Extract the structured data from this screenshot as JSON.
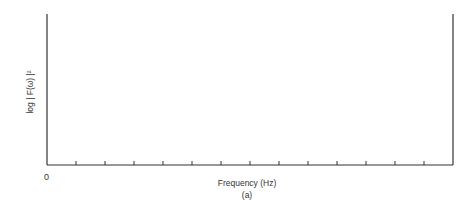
{
  "chart_data": {
    "type": "line",
    "title": "",
    "caption": "(a)",
    "xlabel": "Frequency (Hz)",
    "ylabel": "log | F(ω) |²",
    "x_origin_label": "0",
    "xlim": [
      0,
      14
    ],
    "ylim": [
      0,
      1
    ],
    "x_tick_count": 14,
    "x_tick_spacing": 1,
    "grid": false,
    "legend": "none",
    "annotation": {
      "numerator": "1",
      "denominator": "T",
      "meaning": "null spacing = 1/T",
      "from_x": 2,
      "to_x": 3
    },
    "series": [
      {
        "name": "solid",
        "style": "solid",
        "start_value": 0.48,
        "nulls": [
          {
            "x": 0.45,
            "y": 0.05
          },
          {
            "x": 1.45,
            "y": 0.28
          },
          {
            "x": 2.45,
            "y": 0.29
          },
          {
            "x": 3.45,
            "y": 0.38
          },
          {
            "x": 4.45,
            "y": 0.38
          },
          {
            "x": 5.45,
            "y": 0.34
          },
          {
            "x": 6.45,
            "y": 0.22
          },
          {
            "x": 7.4,
            "y": 0.17
          },
          {
            "x": 8.4,
            "y": 0.22
          },
          {
            "x": 9.4,
            "y": 0.33
          },
          {
            "x": 10.4,
            "y": 0.32
          },
          {
            "x": 11.4,
            "y": 0.16
          }
        ],
        "peaks": [
          {
            "x": 0.95,
            "y": 0.58
          },
          {
            "x": 1.95,
            "y": 0.64
          },
          {
            "x": 2.95,
            "y": 0.76
          },
          {
            "x": 3.95,
            "y": 0.84
          },
          {
            "x": 4.95,
            "y": 0.88
          },
          {
            "x": 5.95,
            "y": 0.77
          },
          {
            "x": 6.9,
            "y": 0.62
          },
          {
            "x": 7.9,
            "y": 0.54
          },
          {
            "x": 8.9,
            "y": 0.56
          },
          {
            "x": 9.9,
            "y": 0.67
          },
          {
            "x": 10.9,
            "y": 0.68
          },
          {
            "x": 11.85,
            "y": 0.52
          },
          {
            "x": 12.8,
            "y": 0.27
          }
        ],
        "end_x": 12.45
      },
      {
        "name": "dashed envelope",
        "style": "dashed",
        "points": [
          [
            0,
            0.14
          ],
          [
            1,
            0.2
          ],
          [
            2,
            0.3
          ],
          [
            3,
            0.44
          ],
          [
            4,
            0.56
          ],
          [
            5,
            0.6
          ],
          [
            5.5,
            0.6
          ],
          [
            6,
            0.56
          ],
          [
            7,
            0.46
          ],
          [
            7.5,
            0.38
          ],
          [
            8,
            0.32
          ],
          [
            8.5,
            0.3
          ],
          [
            9,
            0.3
          ],
          [
            9.5,
            0.32
          ],
          [
            10,
            0.38
          ],
          [
            10.5,
            0.46
          ],
          [
            11,
            0.54
          ],
          [
            11.5,
            0.58
          ],
          [
            12,
            0.56
          ],
          [
            12.5,
            0.42
          ],
          [
            13,
            0.24
          ],
          [
            13.5,
            0.1
          ],
          [
            14,
            0.02
          ],
          [
            14.4,
            0.0
          ]
        ]
      }
    ]
  }
}
